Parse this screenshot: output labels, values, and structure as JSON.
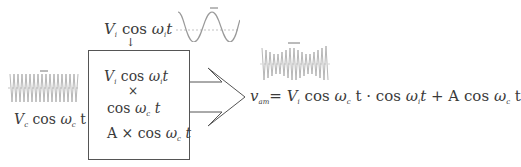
{
  "diagram": {
    "modulating_input": {
      "label_V": "V",
      "label_V_sub": "i",
      "label_cos": "cos",
      "label_omega": "ω",
      "label_omega_sub": "i",
      "label_t": "t",
      "arrow": "↓",
      "waveform": "low-frequency sine wave"
    },
    "carrier_input": {
      "label_V": "V",
      "label_V_sub": "c",
      "label_cos": "cos",
      "label_omega": "ω",
      "label_omega_sub": "c",
      "label_t": "t",
      "arrow": "→",
      "waveform": "high-frequency carrier wave"
    },
    "block": {
      "line1_V": "V",
      "line1_V_sub": "i",
      "line1_cos": "cos",
      "line1_omega": "ω",
      "line1_omega_sub": "i",
      "line1_t": "t",
      "times": "×",
      "line2_cos": "cos",
      "line2_omega": "ω",
      "line2_omega_sub": "c",
      "line2_t": "t",
      "line3_A": "A",
      "line3_times": "×",
      "line3_cos": "cos",
      "line3_omega": "ω",
      "line3_omega_sub": "c",
      "line3_t": "t"
    },
    "output": {
      "v": "v",
      "v_sub": "am",
      "eq": "=",
      "term1_V": "V",
      "term1_V_sub": "i",
      "term1_cos": "cos",
      "term1_omega": "ω",
      "term1_omega_sub": "c",
      "term1_t": "t",
      "dot": "·",
      "term2_cos": "cos",
      "term2_omega": "ω",
      "term2_omega_sub": "i",
      "term2_t": "t",
      "plus": "+",
      "term3_A": "A",
      "term3_cos": "cos",
      "term3_omega": "ω",
      "term3_omega_sub": "c",
      "term3_t": "t",
      "waveform": "amplitude-modulated wave"
    },
    "colors": {
      "line": "#555555",
      "wave": "#9a9a9a",
      "text": "#3a3a3a"
    }
  }
}
